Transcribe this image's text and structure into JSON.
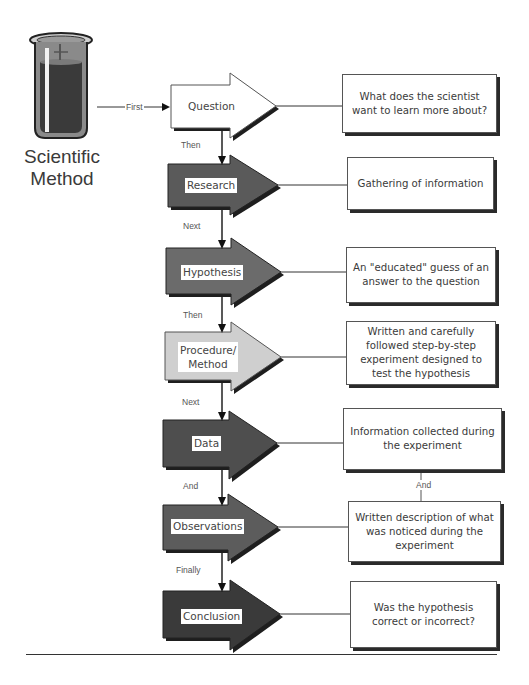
{
  "diagram": {
    "title_line1": "Scientific",
    "title_line2": "Method",
    "icon": "test-tube-icon",
    "entry_connector_label": "First",
    "steps": [
      {
        "label": "Question",
        "description": "What does the scientist want to learn more about?",
        "fill": "#ffffff",
        "connector_to_next": "Then"
      },
      {
        "label": "Research",
        "description": "Gathering of information",
        "fill": "#5a5a5a",
        "connector_to_next": "Next"
      },
      {
        "label": "Hypothesis",
        "description": "An \"educated\" guess of an answer to the question",
        "fill": "#6b6b6b",
        "connector_to_next": "Then"
      },
      {
        "label": "Procedure/ Method",
        "description": "Written and carefully followed step-by-step experiment designed to test the hypothesis",
        "fill": "#cfcfcf",
        "connector_to_next": "Next"
      },
      {
        "label": "Data",
        "description": "Information collected during the experiment",
        "fill": "#4e4e4e",
        "connector_to_next": "And"
      },
      {
        "label": "Observations",
        "description": "Written description of what was noticed during the experiment",
        "fill": "#5c5c5c",
        "connector_to_next": "Finally"
      },
      {
        "label": "Conclusion",
        "description": "Was the hypothesis correct or incorrect?",
        "fill": "#3a3a3a",
        "connector_to_next": null
      }
    ],
    "description_connector_label": "And",
    "colors": {
      "outline": "#222222",
      "shadow": "#1e1e1e",
      "text": "#3a3a3a"
    }
  }
}
